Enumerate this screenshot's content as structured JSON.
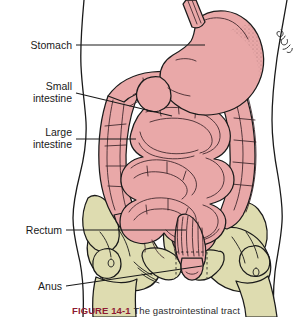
{
  "figure": {
    "title": "The gastrointestinal tract",
    "caption_number": "FIGURE 14-1",
    "caption_body": "The gastrointestinal tract",
    "artist_signature": "artist-signature",
    "background_color": "#ffffff"
  },
  "colors": {
    "organ_pink": "#e9a8a8",
    "organ_pink_shadow": "#d98f92",
    "bone_khaki": "#dedcb0",
    "bone_khaki_shadow": "#cfcb9b",
    "outline_black": "#1a1a1a",
    "caption_maroon": "#8e1b32",
    "background": "#ffffff"
  },
  "labels": [
    {
      "id": "stomach",
      "name": "Stomach",
      "lines": [
        "Stomach"
      ],
      "text_x": 72,
      "text_y": 48,
      "leader_points": "76,45 205,45"
    },
    {
      "id": "small-intestine",
      "name": "Small intestine",
      "lines": [
        "Small",
        "intestine"
      ],
      "text_x": 72,
      "text_y": 92,
      "leader_points": "76,93 170,113"
    },
    {
      "id": "large-intestine",
      "name": "Large intestine",
      "lines": [
        "Large",
        "intestine"
      ],
      "text_x": 72,
      "text_y": 138,
      "leader_points": "76,139 135,139"
    },
    {
      "id": "rectum",
      "name": "Rectum",
      "lines": [
        "Rectum"
      ],
      "text_x": 62,
      "text_y": 233,
      "leader_points": "66,230 186,230"
    },
    {
      "id": "anus",
      "name": "Anus",
      "lines": [
        "Anus"
      ],
      "text_x": 62,
      "text_y": 289,
      "leader_points": "66,286 200,268"
    }
  ],
  "organs": [
    {
      "id": "esophagus",
      "name": "Esophagus",
      "color": "#e9a8a8"
    },
    {
      "id": "stomach",
      "name": "Stomach",
      "color": "#e9a8a8"
    },
    {
      "id": "small-intestine",
      "name": "Small intestine",
      "color": "#e9a8a8"
    },
    {
      "id": "large-intestine",
      "name": "Large intestine",
      "color": "#e9a8a8"
    },
    {
      "id": "rectum",
      "name": "Rectum",
      "color": "#e9a8a8"
    },
    {
      "id": "anus",
      "name": "Anus",
      "color": "#e9a8a8"
    }
  ],
  "skeleton": [
    {
      "id": "pelvis-left",
      "name": "Left pelvic bone",
      "color": "#dedcb0"
    },
    {
      "id": "pelvis-right",
      "name": "Right pelvic bone",
      "color": "#dedcb0"
    },
    {
      "id": "sacrum",
      "name": "Sacrum",
      "color": "#dedcb0"
    },
    {
      "id": "femur-left",
      "name": "Left femur head",
      "color": "#dedcb0"
    },
    {
      "id": "femur-right",
      "name": "Right femur head",
      "color": "#dedcb0"
    }
  ]
}
